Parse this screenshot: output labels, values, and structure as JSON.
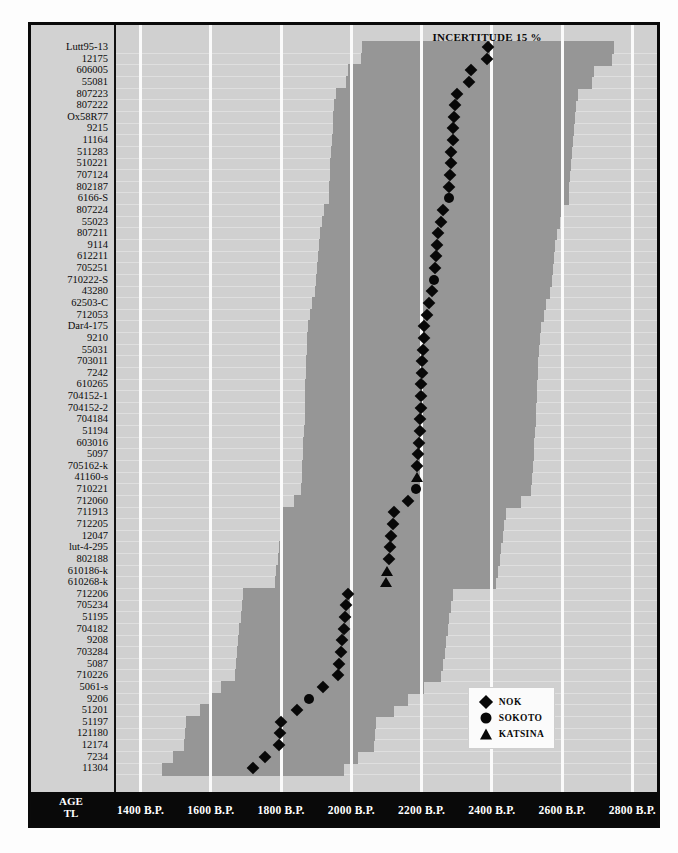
{
  "chart_data": {
    "type": "scatter",
    "title": "",
    "annotation": "INCERTITUDE 15 %",
    "xlabel_lines": [
      "AGE",
      "TL"
    ],
    "xlim": [
      1330,
      2870
    ],
    "xticks": [
      1400,
      1600,
      1800,
      2000,
      2200,
      2400,
      2600,
      2800
    ],
    "xtick_labels": [
      "1400 B.P.",
      "1600 B.P.",
      "1800 B.P.",
      "2000 B.P.",
      "2200 B.P.",
      "2400 B.P.",
      "2600 B.P.",
      "2800 B.P."
    ],
    "grid": true,
    "legend_position": "bottom-right",
    "uncertainty_percent": 15,
    "legend": [
      {
        "label": "NOK",
        "marker": "diamond"
      },
      {
        "label": "SOKOTO",
        "marker": "circle"
      },
      {
        "label": "KATSINA",
        "marker": "triangle"
      }
    ],
    "ylabel": "",
    "samples": [
      {
        "label": "Lutt95-13",
        "age": 2390,
        "group": "NOK"
      },
      {
        "label": "12175",
        "age": 2385,
        "group": "NOK"
      },
      {
        "label": "606005",
        "age": 2340,
        "group": "NOK"
      },
      {
        "label": "55081",
        "age": 2335,
        "group": "NOK"
      },
      {
        "label": "807223",
        "age": 2300,
        "group": "NOK"
      },
      {
        "label": "807222",
        "age": 2296,
        "group": "NOK"
      },
      {
        "label": "Ox58R77",
        "age": 2293,
        "group": "NOK"
      },
      {
        "label": "9215",
        "age": 2290,
        "group": "NOK"
      },
      {
        "label": "11164",
        "age": 2288,
        "group": "NOK"
      },
      {
        "label": "511283",
        "age": 2285,
        "group": "NOK"
      },
      {
        "label": "510221",
        "age": 2283,
        "group": "NOK"
      },
      {
        "label": "707124",
        "age": 2281,
        "group": "NOK"
      },
      {
        "label": "802187",
        "age": 2279,
        "group": "NOK"
      },
      {
        "label": "6166-S",
        "age": 2277,
        "group": "SOKOTO"
      },
      {
        "label": "807224",
        "age": 2262,
        "group": "NOK"
      },
      {
        "label": "55023",
        "age": 2255,
        "group": "NOK"
      },
      {
        "label": "807211",
        "age": 2248,
        "group": "NOK"
      },
      {
        "label": "9114",
        "age": 2244,
        "group": "NOK"
      },
      {
        "label": "612211",
        "age": 2241,
        "group": "NOK"
      },
      {
        "label": "705251",
        "age": 2238,
        "group": "NOK"
      },
      {
        "label": "710222-S",
        "age": 2235,
        "group": "SOKOTO"
      },
      {
        "label": "43280",
        "age": 2230,
        "group": "NOK"
      },
      {
        "label": "62503-C",
        "age": 2222,
        "group": "NOK"
      },
      {
        "label": "712053",
        "age": 2215,
        "group": "NOK"
      },
      {
        "label": "Dar4-175",
        "age": 2208,
        "group": "NOK"
      },
      {
        "label": "9210",
        "age": 2206,
        "group": "NOK"
      },
      {
        "label": "55031",
        "age": 2204,
        "group": "NOK"
      },
      {
        "label": "703011",
        "age": 2202,
        "group": "NOK"
      },
      {
        "label": "7242",
        "age": 2200,
        "group": "NOK"
      },
      {
        "label": "610265",
        "age": 2199,
        "group": "NOK"
      },
      {
        "label": "704152-1",
        "age": 2198,
        "group": "NOK"
      },
      {
        "label": "704152-2",
        "age": 2197,
        "group": "NOK"
      },
      {
        "label": "704184",
        "age": 2196,
        "group": "NOK"
      },
      {
        "label": "51194",
        "age": 2194,
        "group": "NOK"
      },
      {
        "label": "603016",
        "age": 2192,
        "group": "NOK"
      },
      {
        "label": "5097",
        "age": 2190,
        "group": "NOK"
      },
      {
        "label": "705162-k",
        "age": 2188,
        "group": "NOK"
      },
      {
        "label": "41160-s",
        "age": 2186,
        "group": "KATSINA"
      },
      {
        "label": "710221",
        "age": 2184,
        "group": "SOKOTO"
      },
      {
        "label": "712060",
        "age": 2160,
        "group": "NOK"
      },
      {
        "label": "711913",
        "age": 2122,
        "group": "NOK"
      },
      {
        "label": "712205",
        "age": 2118,
        "group": "NOK"
      },
      {
        "label": "12047",
        "age": 2114,
        "group": "NOK"
      },
      {
        "label": "lut-4-295",
        "age": 2110,
        "group": "NOK"
      },
      {
        "label": "802188",
        "age": 2106,
        "group": "NOK"
      },
      {
        "label": "610186-k",
        "age": 2102,
        "group": "KATSINA"
      },
      {
        "label": "610268-k",
        "age": 2098,
        "group": "KATSINA"
      },
      {
        "label": "712206",
        "age": 1990,
        "group": "NOK"
      },
      {
        "label": "705234",
        "age": 1986,
        "group": "NOK"
      },
      {
        "label": "51195",
        "age": 1982,
        "group": "NOK"
      },
      {
        "label": "704182",
        "age": 1978,
        "group": "NOK"
      },
      {
        "label": "9208",
        "age": 1974,
        "group": "NOK"
      },
      {
        "label": "703284",
        "age": 1970,
        "group": "NOK"
      },
      {
        "label": "5087",
        "age": 1966,
        "group": "NOK"
      },
      {
        "label": "710226",
        "age": 1962,
        "group": "NOK"
      },
      {
        "label": "5061-s",
        "age": 1918,
        "group": "NOK"
      },
      {
        "label": "9206",
        "age": 1880,
        "group": "SOKOTO"
      },
      {
        "label": "51201",
        "age": 1845,
        "group": "NOK"
      },
      {
        "label": "51197",
        "age": 1800,
        "group": "NOK"
      },
      {
        "label": "121180",
        "age": 1797,
        "group": "NOK"
      },
      {
        "label": "12174",
        "age": 1794,
        "group": "NOK"
      },
      {
        "label": "7234",
        "age": 1755,
        "group": "NOK"
      },
      {
        "label": "11304",
        "age": 1720,
        "group": "NOK"
      }
    ]
  }
}
